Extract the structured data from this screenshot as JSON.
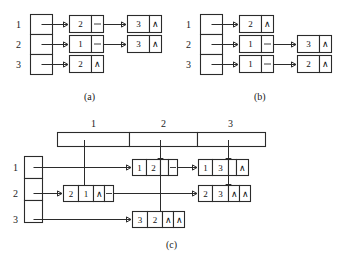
{
  "figure": {
    "captions": [
      {
        "id": "a",
        "text": "(a)"
      },
      {
        "id": "b",
        "text": "(b)"
      },
      {
        "id": "c",
        "text": "(c)"
      }
    ],
    "null_glyph": "∧"
  },
  "panel_a": {
    "caption": "(a)",
    "row_index_labels": [
      "1",
      "2",
      "3"
    ],
    "head_array_cells": [
      "",
      "",
      ""
    ],
    "rows": [
      {
        "index": "1",
        "nodes": [
          {
            "value": "2",
            "link": "next"
          },
          {
            "value": "3",
            "link": "null"
          }
        ]
      },
      {
        "index": "2",
        "nodes": [
          {
            "value": "1",
            "link": "next"
          },
          {
            "value": "3",
            "link": "null"
          }
        ]
      },
      {
        "index": "3",
        "nodes": [
          {
            "value": "2",
            "link": "null"
          }
        ]
      }
    ]
  },
  "panel_b": {
    "caption": "(b)",
    "row_index_labels": [
      "1",
      "2",
      "3"
    ],
    "head_array_cells": [
      "",
      "",
      ""
    ],
    "rows": [
      {
        "index": "1",
        "nodes": [
          {
            "value": "2",
            "link": "null"
          }
        ]
      },
      {
        "index": "2",
        "nodes": [
          {
            "value": "1",
            "link": "next"
          },
          {
            "value": "3",
            "link": "null"
          }
        ]
      },
      {
        "index": "3",
        "nodes": [
          {
            "value": "1",
            "link": "next"
          },
          {
            "value": "2",
            "link": "null"
          }
        ]
      }
    ]
  },
  "panel_c": {
    "caption": "(c)",
    "column_header_labels": [
      "1",
      "2",
      "3"
    ],
    "row_index_labels": [
      "1",
      "2",
      "3"
    ],
    "row_head_array_cells": [
      "",
      "",
      ""
    ],
    "column_head_array_cells": [
      "",
      "",
      ""
    ],
    "rows": [
      {
        "index": "1",
        "nodes": [
          {
            "fields": [
              "1",
              "2"
            ],
            "down": "link",
            "right": "link"
          },
          {
            "fields": [
              "1",
              "3"
            ],
            "down": "link",
            "right": "null"
          }
        ]
      },
      {
        "index": "2",
        "nodes": [
          {
            "fields": [
              "2",
              "1"
            ],
            "down": "null",
            "right": "link"
          },
          {
            "fields": [
              "2",
              "3"
            ],
            "down": "null",
            "right": "null"
          }
        ]
      },
      {
        "index": "3",
        "nodes": [
          {
            "fields": [
              "3",
              "2"
            ],
            "down": "null",
            "right": "null"
          }
        ]
      }
    ]
  }
}
